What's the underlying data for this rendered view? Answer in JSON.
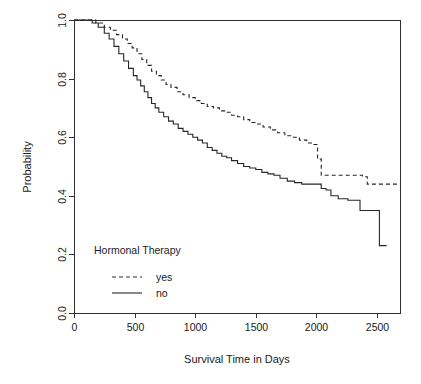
{
  "chart_data": {
    "type": "line",
    "title": "",
    "subtitle": "",
    "xlabel": "Survival Time in Days",
    "ylabel": "Probability",
    "xlim": [
      0,
      2690
    ],
    "ylim": [
      0.0,
      1.0
    ],
    "xticks": [
      0,
      500,
      1000,
      1500,
      2000,
      2500
    ],
    "xticklabels": [
      "0",
      "500",
      "1000",
      "1500",
      "2000",
      "2500"
    ],
    "yticks": [
      0.0,
      0.2,
      0.4,
      0.6,
      0.8,
      1.0
    ],
    "yticklabels": [
      "0.0",
      "0.2",
      "0.4",
      "0.6",
      "0.8",
      "1.0"
    ],
    "grid": false,
    "legend": {
      "title": "Hormonal Therapy",
      "position": "inside-lower-left",
      "entries": [
        {
          "label": "yes",
          "style": "dashed"
        },
        {
          "label": "no",
          "style": "solid"
        }
      ]
    },
    "annotations": [],
    "series": [
      {
        "name": "yes",
        "style": "dashed",
        "step": true,
        "x": [
          0,
          100,
          180,
          250,
          300,
          350,
          400,
          440,
          480,
          520,
          560,
          600,
          640,
          680,
          720,
          760,
          800,
          850,
          900,
          950,
          1000,
          1050,
          1100,
          1150,
          1200,
          1250,
          1300,
          1350,
          1400,
          1450,
          1500,
          1560,
          1620,
          1680,
          1740,
          1800,
          1860,
          1920,
          1980,
          2010,
          2040,
          2100,
          2200,
          2300,
          2380,
          2420,
          2500,
          2600,
          2690
        ],
        "y": [
          1.0,
          1.0,
          0.99,
          0.975,
          0.965,
          0.95,
          0.935,
          0.92,
          0.905,
          0.885,
          0.865,
          0.845,
          0.825,
          0.81,
          0.795,
          0.78,
          0.77,
          0.755,
          0.745,
          0.735,
          0.725,
          0.715,
          0.705,
          0.7,
          0.69,
          0.685,
          0.675,
          0.67,
          0.66,
          0.65,
          0.645,
          0.635,
          0.625,
          0.615,
          0.605,
          0.6,
          0.59,
          0.58,
          0.575,
          0.525,
          0.47,
          0.47,
          0.47,
          0.47,
          0.465,
          0.44,
          0.44,
          0.44,
          0.44
        ]
      },
      {
        "name": "no",
        "style": "solid",
        "step": true,
        "x": [
          0,
          90,
          150,
          200,
          250,
          290,
          330,
          370,
          410,
          450,
          490,
          520,
          550,
          580,
          610,
          640,
          670,
          700,
          740,
          780,
          820,
          860,
          900,
          940,
          980,
          1020,
          1060,
          1100,
          1140,
          1180,
          1220,
          1260,
          1300,
          1350,
          1400,
          1450,
          1500,
          1550,
          1600,
          1650,
          1700,
          1760,
          1820,
          1880,
          1940,
          2000,
          2040,
          2080,
          2120,
          2180,
          2260,
          2300,
          2360,
          2420,
          2460,
          2520,
          2580
        ],
        "y": [
          1.0,
          1.0,
          0.99,
          0.975,
          0.955,
          0.935,
          0.91,
          0.885,
          0.86,
          0.835,
          0.81,
          0.795,
          0.775,
          0.755,
          0.735,
          0.715,
          0.7,
          0.685,
          0.67,
          0.655,
          0.645,
          0.63,
          0.62,
          0.61,
          0.6,
          0.59,
          0.58,
          0.565,
          0.555,
          0.545,
          0.535,
          0.53,
          0.52,
          0.51,
          0.5,
          0.495,
          0.49,
          0.48,
          0.475,
          0.47,
          0.46,
          0.45,
          0.445,
          0.44,
          0.44,
          0.44,
          0.425,
          0.42,
          0.4,
          0.39,
          0.385,
          0.385,
          0.35,
          0.35,
          0.35,
          0.23,
          0.23
        ]
      }
    ]
  },
  "plot_geometry": {
    "left": 74,
    "right": 400,
    "top": 20,
    "bottom": 313
  }
}
